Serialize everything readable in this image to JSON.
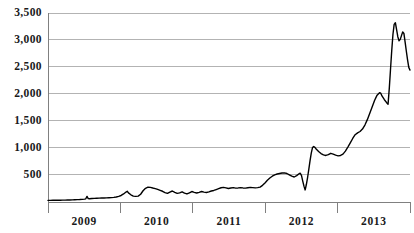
{
  "chart_data": {
    "type": "line",
    "title": "",
    "subtitle": "",
    "xlabel": "",
    "ylabel": "",
    "grid": true,
    "legend": false,
    "legend_position": "none",
    "line_color": "#000000",
    "grid_color": "#b3b3b3",
    "axis_color": "#808080",
    "background_color": "#ffffff",
    "ylim": [
      0,
      3600
    ],
    "xlim": [
      2008.58,
      2013.66
    ],
    "y_ticks": [
      500,
      1000,
      1500,
      2000,
      2500,
      3000,
      3500
    ],
    "y_tick_labels": [
      "500",
      "1,000",
      "1,500",
      "2,000",
      "2,500",
      "3,000",
      "3,500"
    ],
    "x_ticks": [
      2009,
      2010,
      2011,
      2012,
      2013
    ],
    "x_tick_labels": [
      "2009",
      "2010",
      "2011",
      "2012",
      "2013"
    ],
    "x": [
      2008.58,
      2008.67,
      2008.75,
      2008.83,
      2008.92,
      2009.0,
      2009.08,
      2009.17,
      2009.25,
      2009.33,
      2009.42,
      2009.5,
      2009.58,
      2009.67,
      2009.75,
      2009.83,
      2009.92,
      2010.0,
      2010.08,
      2010.17,
      2010.25,
      2010.33,
      2010.42,
      2010.5,
      2010.58,
      2010.67,
      2010.75,
      2010.83,
      2010.92,
      2011.0,
      2011.08,
      2011.17,
      2011.25,
      2011.33,
      2011.42,
      2011.5,
      2011.58,
      2011.67,
      2011.75,
      2011.83,
      2011.92,
      2012.0,
      2012.08,
      2012.17,
      2012.25,
      2012.33,
      2012.42,
      2012.5,
      2012.58,
      2012.67,
      2012.75,
      2012.83,
      2012.92,
      2013.0,
      2013.08,
      2013.17,
      2013.25,
      2013.33,
      2013.42,
      2013.5,
      2013.58,
      2013.66
    ],
    "values": [
      20,
      22,
      24,
      26,
      28,
      30,
      34,
      38,
      44,
      95,
      55,
      58,
      60,
      62,
      66,
      70,
      74,
      80,
      90,
      110,
      150,
      190,
      130,
      100,
      95,
      115,
      230,
      265,
      255,
      230,
      200,
      165,
      190,
      155,
      175,
      130,
      165,
      145,
      175,
      200,
      185,
      175,
      205,
      235,
      260,
      250,
      245,
      265,
      250,
      255,
      260,
      330,
      430,
      495,
      520,
      535,
      470,
      525,
      215,
      620,
      1020,
      960
    ],
    "series_note": "monthly values, single series",
    "annotations": []
  },
  "chart_path_data": {
    "points": [
      [
        0,
        20
      ],
      [
        2,
        20
      ],
      [
        4,
        22
      ],
      [
        6,
        22
      ],
      [
        8,
        24
      ],
      [
        10,
        24
      ],
      [
        12,
        26
      ],
      [
        14,
        26
      ],
      [
        16,
        28
      ],
      [
        18,
        28
      ],
      [
        20,
        30
      ],
      [
        22,
        32
      ],
      [
        24,
        34
      ],
      [
        26,
        36
      ],
      [
        28,
        40
      ],
      [
        30,
        44
      ],
      [
        31,
        50
      ],
      [
        32,
        95
      ],
      [
        33,
        55
      ],
      [
        34,
        52
      ],
      [
        36,
        56
      ],
      [
        38,
        58
      ],
      [
        40,
        60
      ],
      [
        42,
        62
      ],
      [
        44,
        64
      ],
      [
        46,
        66
      ],
      [
        48,
        68
      ],
      [
        50,
        70
      ],
      [
        52,
        72
      ],
      [
        54,
        76
      ],
      [
        56,
        84
      ],
      [
        58,
        96
      ],
      [
        60,
        112
      ],
      [
        62,
        140
      ],
      [
        64,
        175
      ],
      [
        65,
        190
      ],
      [
        66,
        160
      ],
      [
        68,
        125
      ],
      [
        70,
        100
      ],
      [
        72,
        95
      ],
      [
        74,
        100
      ],
      [
        76,
        135
      ],
      [
        78,
        200
      ],
      [
        80,
        245
      ],
      [
        82,
        265
      ],
      [
        84,
        262
      ],
      [
        86,
        250
      ],
      [
        88,
        240
      ],
      [
        90,
        225
      ],
      [
        92,
        208
      ],
      [
        94,
        190
      ],
      [
        96,
        165
      ],
      [
        98,
        150
      ],
      [
        100,
        175
      ],
      [
        102,
        195
      ],
      [
        104,
        170
      ],
      [
        106,
        150
      ],
      [
        108,
        160
      ],
      [
        110,
        180
      ],
      [
        112,
        155
      ],
      [
        114,
        140
      ],
      [
        116,
        160
      ],
      [
        118,
        185
      ],
      [
        120,
        170
      ],
      [
        122,
        158
      ],
      [
        124,
        170
      ],
      [
        126,
        185
      ],
      [
        128,
        175
      ],
      [
        130,
        168
      ],
      [
        132,
        178
      ],
      [
        134,
        195
      ],
      [
        136,
        205
      ],
      [
        138,
        222
      ],
      [
        140,
        238
      ],
      [
        142,
        255
      ],
      [
        144,
        262
      ],
      [
        146,
        252
      ],
      [
        148,
        242
      ],
      [
        150,
        250
      ],
      [
        152,
        258
      ],
      [
        154,
        248
      ],
      [
        156,
        252
      ],
      [
        158,
        258
      ],
      [
        160,
        252
      ],
      [
        162,
        248
      ],
      [
        164,
        255
      ],
      [
        166,
        262
      ],
      [
        168,
        258
      ],
      [
        170,
        252
      ],
      [
        172,
        258
      ],
      [
        174,
        268
      ],
      [
        176,
        300
      ],
      [
        178,
        345
      ],
      [
        180,
        395
      ],
      [
        182,
        435
      ],
      [
        184,
        470
      ],
      [
        186,
        495
      ],
      [
        188,
        510
      ],
      [
        190,
        520
      ],
      [
        192,
        530
      ],
      [
        194,
        532
      ],
      [
        196,
        520
      ],
      [
        198,
        495
      ],
      [
        200,
        470
      ],
      [
        202,
        455
      ],
      [
        204,
        480
      ],
      [
        206,
        515
      ],
      [
        207,
        525
      ],
      [
        208,
        480
      ],
      [
        209,
        380
      ],
      [
        210,
        285
      ],
      [
        211,
        215
      ],
      [
        212,
        320
      ],
      [
        213,
        450
      ],
      [
        214,
        600
      ],
      [
        215,
        760
      ],
      [
        216,
        900
      ],
      [
        217,
        1000
      ],
      [
        218,
        1020
      ],
      [
        219,
        1005
      ],
      [
        220,
        975
      ],
      [
        222,
        930
      ],
      [
        224,
        890
      ],
      [
        226,
        865
      ],
      [
        228,
        855
      ],
      [
        230,
        870
      ],
      [
        232,
        895
      ],
      [
        234,
        880
      ],
      [
        236,
        862
      ],
      [
        238,
        848
      ],
      [
        240,
        855
      ],
      [
        242,
        880
      ],
      [
        244,
        935
      ],
      [
        246,
        1010
      ],
      [
        248,
        1090
      ],
      [
        250,
        1170
      ],
      [
        252,
        1240
      ],
      [
        254,
        1275
      ],
      [
        256,
        1300
      ],
      [
        258,
        1345
      ],
      [
        260,
        1420
      ],
      [
        262,
        1520
      ],
      [
        264,
        1640
      ],
      [
        266,
        1760
      ],
      [
        268,
        1880
      ],
      [
        270,
        1975
      ],
      [
        272,
        2020
      ],
      [
        273,
        2010
      ],
      [
        274,
        1960
      ],
      [
        276,
        1890
      ],
      [
        278,
        1830
      ],
      [
        279,
        1805
      ],
      [
        280,
        2100
      ],
      [
        281,
        2450
      ],
      [
        282,
        2800
      ],
      [
        283,
        3100
      ],
      [
        284,
        3290
      ],
      [
        285,
        3320
      ],
      [
        286,
        3190
      ],
      [
        287,
        3060
      ],
      [
        288,
        2985
      ],
      [
        289,
        3010
      ],
      [
        290,
        3080
      ],
      [
        291,
        3150
      ],
      [
        292,
        3120
      ],
      [
        293,
        2960
      ],
      [
        294,
        2790
      ],
      [
        295,
        2630
      ],
      [
        296,
        2490
      ],
      [
        297,
        2440
      ]
    ]
  }
}
